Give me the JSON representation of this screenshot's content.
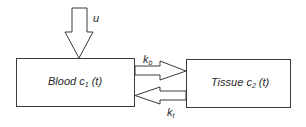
{
  "diagram": {
    "type": "two-compartment-model",
    "colors": {
      "stroke": "#3a3a3a",
      "fill": "#ffffff",
      "text": "#2a2a2a"
    },
    "input": {
      "label": "u"
    },
    "compartments": [
      {
        "id": "blood",
        "name": "Blood",
        "var": "c",
        "sub": "1",
        "arg": "(t)"
      },
      {
        "id": "tissue",
        "name": "Tissue",
        "var": "c",
        "sub": "2",
        "arg": "(t)"
      }
    ],
    "flows": [
      {
        "from": "blood",
        "to": "tissue",
        "rate": "k",
        "rate_sub": "b"
      },
      {
        "from": "tissue",
        "to": "blood",
        "rate": "k",
        "rate_sub": "t"
      }
    ]
  }
}
